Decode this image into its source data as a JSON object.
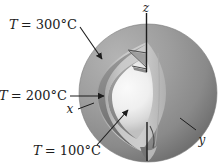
{
  "figure": {
    "isotherm_labels": {
      "t300": {
        "var": "T",
        "rest": "= 300°C",
        "temperature_c": 300
      },
      "t200": {
        "var": "T",
        "rest": "= 200°C",
        "temperature_c": 200
      },
      "t100": {
        "var": "T",
        "rest": "= 100°C",
        "temperature_c": 100
      }
    },
    "axis_labels": {
      "z": "z",
      "x": "x",
      "y": "y"
    },
    "colors": {
      "background": "#ffffff",
      "outer_sphere": "#8f8f8f",
      "outer_sphere_highlight": "#b4b4b4",
      "outer_sphere_edge": "#6b6b6b",
      "shell_cut_edge": "#7a7a7a",
      "middle_sphere": "#c9c9c9",
      "inner_sphere_center": "#fafafa",
      "line": "#1c1c1c"
    }
  }
}
